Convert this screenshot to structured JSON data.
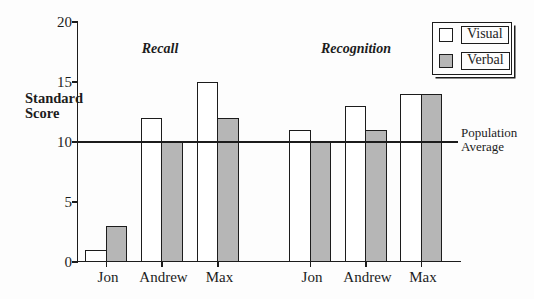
{
  "figure": {
    "background": "#fdfdfd",
    "ink_color": "#1c1c1c"
  },
  "chart_data": {
    "type": "bar",
    "title": "",
    "ylabel": "Standard Score",
    "xlabel": "",
    "ylim": [
      0,
      20
    ],
    "yticks": [
      20,
      15,
      10,
      5,
      0
    ],
    "grid": false,
    "groups": [
      {
        "label": "Recall",
        "categories": [
          "Jon",
          "Andrew",
          "Max"
        ],
        "series": [
          {
            "name": "Visual",
            "values": [
              1,
              12,
              15
            ]
          },
          {
            "name": "Verbal",
            "values": [
              3,
              10,
              12
            ]
          }
        ]
      },
      {
        "label": "Recognition",
        "categories": [
          "Jon",
          "Andrew",
          "Max"
        ],
        "series": [
          {
            "name": "Visual",
            "values": [
              11,
              13,
              14
            ]
          },
          {
            "name": "Verbal",
            "values": [
              10,
              11,
              14
            ]
          }
        ]
      }
    ],
    "reference_line": {
      "value": 10,
      "label": "Population Average"
    },
    "legend": {
      "position": "top-right",
      "items": [
        {
          "label": "Visual",
          "color": "#ffffff"
        },
        {
          "label": "Verbal",
          "color": "#b6b6b6"
        }
      ]
    }
  }
}
